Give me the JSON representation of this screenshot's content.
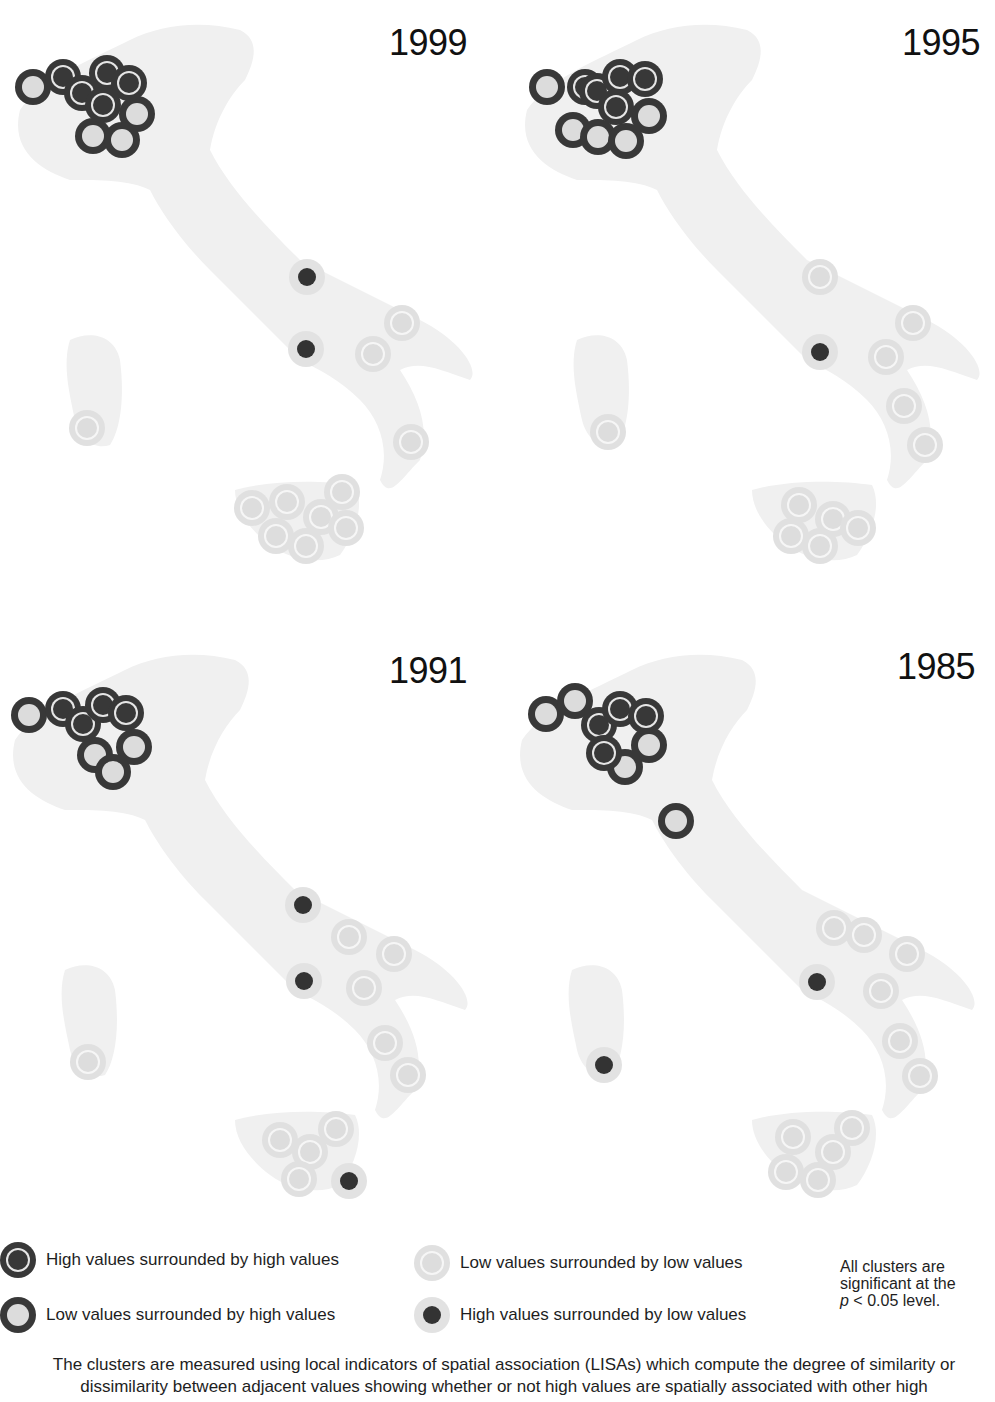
{
  "figure": {
    "panels": [
      {
        "year": "1999",
        "offset": [
          0,
          0
        ],
        "markers": [
          {
            "x": 33,
            "y": 87,
            "type": "LH"
          },
          {
            "x": 63,
            "y": 77,
            "type": "HH"
          },
          {
            "x": 82,
            "y": 93,
            "type": "HH"
          },
          {
            "x": 107,
            "y": 73,
            "type": "HH"
          },
          {
            "x": 129,
            "y": 83,
            "type": "HH"
          },
          {
            "x": 103,
            "y": 105,
            "type": "HH"
          },
          {
            "x": 137,
            "y": 114,
            "type": "LH"
          },
          {
            "x": 93,
            "y": 136,
            "type": "LH"
          },
          {
            "x": 122,
            "y": 140,
            "type": "LH"
          },
          {
            "x": 307,
            "y": 277,
            "type": "HL"
          },
          {
            "x": 306,
            "y": 349,
            "type": "HL"
          },
          {
            "x": 402,
            "y": 323,
            "type": "LL"
          },
          {
            "x": 373,
            "y": 354,
            "type": "LL"
          },
          {
            "x": 87,
            "y": 428,
            "type": "LL"
          },
          {
            "x": 411,
            "y": 442,
            "type": "LL"
          },
          {
            "x": 252,
            "y": 508,
            "type": "LL"
          },
          {
            "x": 287,
            "y": 502,
            "type": "LL"
          },
          {
            "x": 342,
            "y": 492,
            "type": "LL"
          },
          {
            "x": 321,
            "y": 517,
            "type": "LL"
          },
          {
            "x": 346,
            "y": 528,
            "type": "LL"
          },
          {
            "x": 276,
            "y": 536,
            "type": "LL"
          },
          {
            "x": 306,
            "y": 546,
            "type": "LL"
          }
        ]
      },
      {
        "year": "1995",
        "offset": [
          497,
          0
        ],
        "markers": [
          {
            "x": 547,
            "y": 87,
            "type": "LH"
          },
          {
            "x": 585,
            "y": 87,
            "type": "HH"
          },
          {
            "x": 597,
            "y": 91,
            "type": "HH"
          },
          {
            "x": 620,
            "y": 77,
            "type": "HH"
          },
          {
            "x": 645,
            "y": 79,
            "type": "HH"
          },
          {
            "x": 616,
            "y": 107,
            "type": "HH"
          },
          {
            "x": 649,
            "y": 116,
            "type": "LH"
          },
          {
            "x": 573,
            "y": 130,
            "type": "LH"
          },
          {
            "x": 598,
            "y": 137,
            "type": "LH"
          },
          {
            "x": 626,
            "y": 141,
            "type": "LH"
          },
          {
            "x": 820,
            "y": 277,
            "type": "LL"
          },
          {
            "x": 820,
            "y": 352,
            "type": "HL"
          },
          {
            "x": 913,
            "y": 323,
            "type": "LL"
          },
          {
            "x": 886,
            "y": 357,
            "type": "LL"
          },
          {
            "x": 904,
            "y": 406,
            "type": "LL"
          },
          {
            "x": 925,
            "y": 445,
            "type": "LL"
          },
          {
            "x": 608,
            "y": 432,
            "type": "LL"
          },
          {
            "x": 799,
            "y": 505,
            "type": "LL"
          },
          {
            "x": 833,
            "y": 519,
            "type": "LL"
          },
          {
            "x": 858,
            "y": 528,
            "type": "LL"
          },
          {
            "x": 791,
            "y": 536,
            "type": "LL"
          },
          {
            "x": 820,
            "y": 546,
            "type": "LL"
          }
        ]
      },
      {
        "year": "1991",
        "offset": [
          0,
          620
        ],
        "markers": [
          {
            "x": 29,
            "y": 715,
            "type": "LH"
          },
          {
            "x": 63,
            "y": 709,
            "type": "HH"
          },
          {
            "x": 83,
            "y": 724,
            "type": "HH"
          },
          {
            "x": 103,
            "y": 705,
            "type": "HH"
          },
          {
            "x": 126,
            "y": 713,
            "type": "HH"
          },
          {
            "x": 134,
            "y": 747,
            "type": "LH"
          },
          {
            "x": 95,
            "y": 755,
            "type": "LH"
          },
          {
            "x": 113,
            "y": 772,
            "type": "LH"
          },
          {
            "x": 303,
            "y": 905,
            "type": "HL"
          },
          {
            "x": 304,
            "y": 981,
            "type": "HL"
          },
          {
            "x": 349,
            "y": 937,
            "type": "LL"
          },
          {
            "x": 394,
            "y": 954,
            "type": "LL"
          },
          {
            "x": 364,
            "y": 988,
            "type": "LL"
          },
          {
            "x": 385,
            "y": 1043,
            "type": "LL"
          },
          {
            "x": 408,
            "y": 1075,
            "type": "LL"
          },
          {
            "x": 88,
            "y": 1062,
            "type": "LL"
          },
          {
            "x": 280,
            "y": 1140,
            "type": "LL"
          },
          {
            "x": 310,
            "y": 1152,
            "type": "LL"
          },
          {
            "x": 336,
            "y": 1129,
            "type": "LL"
          },
          {
            "x": 299,
            "y": 1179,
            "type": "LL"
          },
          {
            "x": 349,
            "y": 1181,
            "type": "HL"
          }
        ]
      },
      {
        "year": "1985",
        "offset": [
          497,
          620
        ],
        "markers": [
          {
            "x": 546,
            "y": 714,
            "type": "LH"
          },
          {
            "x": 575,
            "y": 701,
            "type": "LH"
          },
          {
            "x": 599,
            "y": 725,
            "type": "HH"
          },
          {
            "x": 620,
            "y": 709,
            "type": "HH"
          },
          {
            "x": 646,
            "y": 716,
            "type": "HH"
          },
          {
            "x": 649,
            "y": 745,
            "type": "LH"
          },
          {
            "x": 604,
            "y": 753,
            "type": "HH"
          },
          {
            "x": 625,
            "y": 767,
            "type": "LH"
          },
          {
            "x": 676,
            "y": 821,
            "type": "LH"
          },
          {
            "x": 834,
            "y": 928,
            "type": "LL"
          },
          {
            "x": 864,
            "y": 935,
            "type": "LL"
          },
          {
            "x": 907,
            "y": 954,
            "type": "LL"
          },
          {
            "x": 817,
            "y": 982,
            "type": "HL"
          },
          {
            "x": 881,
            "y": 991,
            "type": "LL"
          },
          {
            "x": 900,
            "y": 1041,
            "type": "LL"
          },
          {
            "x": 920,
            "y": 1076,
            "type": "LL"
          },
          {
            "x": 604,
            "y": 1065,
            "type": "HL"
          },
          {
            "x": 793,
            "y": 1137,
            "type": "LL"
          },
          {
            "x": 852,
            "y": 1128,
            "type": "LL"
          },
          {
            "x": 833,
            "y": 1152,
            "type": "LL"
          },
          {
            "x": 786,
            "y": 1172,
            "type": "LL"
          },
          {
            "x": 818,
            "y": 1180,
            "type": "LL"
          }
        ]
      }
    ]
  },
  "legend": {
    "items": [
      {
        "type": "HH",
        "label": "High values surrounded by high values"
      },
      {
        "type": "LH",
        "label": "Low values surrounded by high values"
      },
      {
        "type": "LL",
        "label": "Low values surrounded by low values"
      },
      {
        "type": "HL",
        "label": "High values surrounded by low values"
      }
    ],
    "note_line1": "All clusters are",
    "note_line2": "significant at the",
    "note_p": "p",
    "note_line3": " < 0.05 level."
  },
  "caption": "The clusters are measured using local indicators of spatial association (LISAs) which compute the degree of similarity or dissimilarity between adjacent values showing whether or not high values are spatially associated with other high",
  "colors": {
    "map_fill": "#efefef",
    "dark_marker": "#383838",
    "light_marker": "#e0e0e0"
  }
}
